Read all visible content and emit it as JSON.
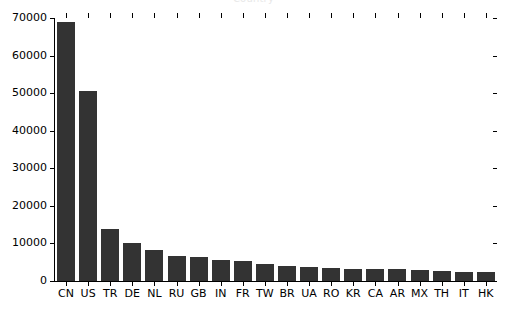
{
  "chart_data": {
    "type": "bar",
    "title": "Country",
    "xlabel": "",
    "ylabel": "",
    "ylim": [
      0,
      70000
    ],
    "ytick_values": [
      0,
      10000,
      20000,
      30000,
      40000,
      50000,
      60000,
      70000
    ],
    "ytick_labels": [
      "0",
      "10000",
      "20000",
      "30000",
      "40000",
      "50000",
      "60000",
      "70000"
    ],
    "grid": false,
    "legend": null,
    "bar_color": "#333333",
    "background_color": "#ffffff",
    "categories": [
      "CN",
      "US",
      "TR",
      "DE",
      "NL",
      "RU",
      "GB",
      "IN",
      "FR",
      "TW",
      "BR",
      "UA",
      "RO",
      "KR",
      "CA",
      "AR",
      "MX",
      "TH",
      "IT",
      "HK"
    ],
    "values": [
      69000,
      50500,
      13800,
      10000,
      8200,
      6600,
      6400,
      5600,
      5200,
      4400,
      3900,
      3600,
      3400,
      3300,
      3200,
      3100,
      3000,
      2600,
      2400,
      2300
    ]
  },
  "figure": {
    "width": 507,
    "height": 311
  }
}
